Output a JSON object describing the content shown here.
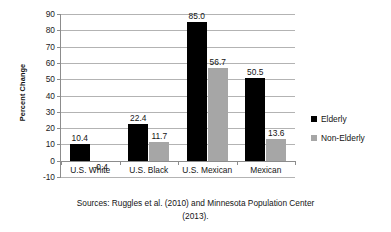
{
  "chart_data": {
    "type": "bar",
    "title": "",
    "xlabel": "",
    "ylabel": "Percent Change",
    "categories": [
      "U.S. White",
      "U.S. Black",
      "U.S. Mexican",
      "Mexican"
    ],
    "series": [
      {
        "name": "Elderly",
        "color": "#000000",
        "values": [
          10.4,
          22.4,
          85.0,
          50.5
        ],
        "labels": [
          "10.4",
          "22.4",
          "85.0",
          "50.5"
        ]
      },
      {
        "name": "Non-Elderly",
        "color": "#a6a6a6",
        "values": [
          -0.4,
          11.7,
          56.7,
          13.6
        ],
        "labels": [
          "-0.4",
          "11.7",
          "56.7",
          "13.6"
        ]
      }
    ],
    "ylim": [
      -10,
      90
    ],
    "ytick_step": 10,
    "yticks": [
      "90",
      "80",
      "70",
      "60",
      "50",
      "40",
      "30",
      "20",
      "10",
      "0",
      "-10"
    ],
    "grid": true,
    "legend_position": "right",
    "caption_lines": [
      "Sources: Ruggles et al. (2010) and Minnesota Population Center",
      "(2013)."
    ]
  },
  "legend": {
    "items": [
      {
        "label": "Elderly",
        "swatch": "#000000"
      },
      {
        "label": "Non-Elderly",
        "swatch": "#a6a6a6"
      }
    ]
  },
  "caption": {
    "line1": "Sources: Ruggles et al. (2010) and Minnesota Population Center",
    "line2": "(2013)."
  }
}
